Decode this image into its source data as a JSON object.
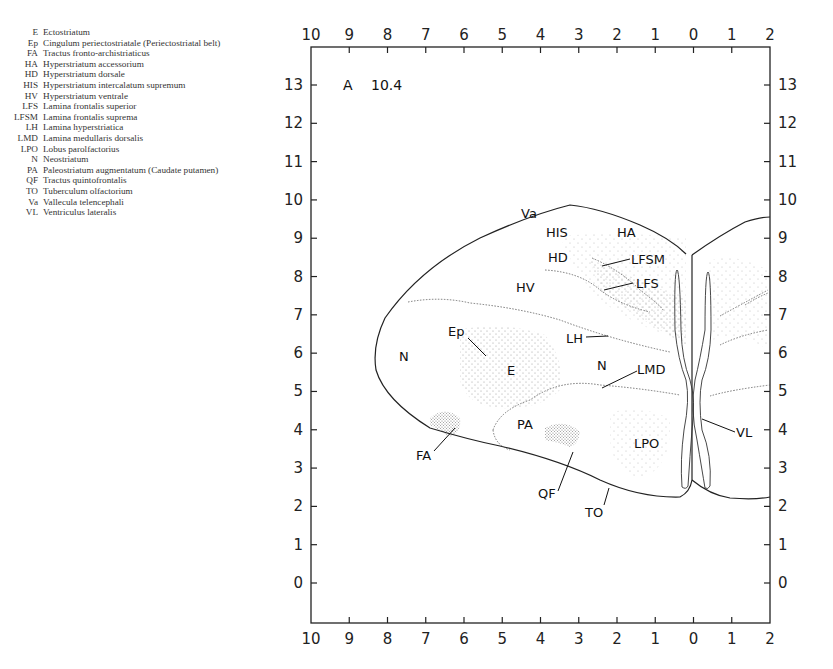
{
  "legend": [
    {
      "abbr": "E",
      "name": "Ectostriatum"
    },
    {
      "abbr": "Ep",
      "name": "Cingulum periectostriatale (Periectostriatal belt)"
    },
    {
      "abbr": "FA",
      "name": "Tractus fronto-archistriaticus"
    },
    {
      "abbr": "HA",
      "name": "Hyperstriatum accessorium"
    },
    {
      "abbr": "HD",
      "name": "Hyperstriatum dorsale"
    },
    {
      "abbr": "HIS",
      "name": "Hyperstriatum intercalatum supremum"
    },
    {
      "abbr": "HV",
      "name": "Hyperstriatum ventrale"
    },
    {
      "abbr": "LFS",
      "name": "Lamina frontalis superior"
    },
    {
      "abbr": "LFSM",
      "name": "Lamina frontalis suprema"
    },
    {
      "abbr": "LH",
      "name": "Lamina hyperstriatica"
    },
    {
      "abbr": "LMD",
      "name": "Lamina medullaris dorsalis"
    },
    {
      "abbr": "LPO",
      "name": "Lobus parolfactorius"
    },
    {
      "abbr": "N",
      "name": "Neostriatum"
    },
    {
      "abbr": "PA",
      "name": "Paleostriatum augmentatum (Caudate putamen)"
    },
    {
      "abbr": "QF",
      "name": "Tractus quintofrontalis"
    },
    {
      "abbr": "TO",
      "name": "Tuberculum olfactorium"
    },
    {
      "abbr": "Va",
      "name": "Vallecula telencephali"
    },
    {
      "abbr": "VL",
      "name": "Ventriculus lateralis"
    }
  ],
  "plate": {
    "letter": "A",
    "number": "10.4"
  },
  "axes": {
    "x_ticks": [
      "10",
      "9",
      "8",
      "7",
      "6",
      "5",
      "4",
      "3",
      "2",
      "1",
      "0",
      "1",
      "2"
    ],
    "y_ticks": [
      "13",
      "12",
      "11",
      "10",
      "9",
      "8",
      "7",
      "6",
      "5",
      "4",
      "3",
      "2",
      "1",
      "0"
    ]
  },
  "regions": {
    "Va": "Va",
    "HIS": "HIS",
    "HA": "HA",
    "HD": "HD",
    "LFSM": "LFSM",
    "LFS": "LFS",
    "HV": "HV",
    "LH": "LH",
    "Ep": "Ep",
    "N_left": "N",
    "E": "E",
    "N_mid": "N",
    "LMD": "LMD",
    "PA": "PA",
    "LPO": "LPO",
    "VL": "VL",
    "FA": "FA",
    "QF": "QF",
    "TO": "TO"
  },
  "colors": {
    "line": "#222222",
    "stipple": "#9a9a9a",
    "background": "#ffffff"
  }
}
